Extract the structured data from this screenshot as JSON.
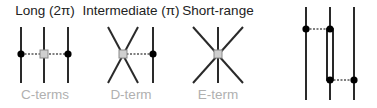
{
  "panels": [
    {
      "title": "Long (2π)",
      "subtitle": "C-terms"
    },
    {
      "title": "Intermediate (π)",
      "subtitle": "D-term"
    },
    {
      "title": "Short-range",
      "subtitle": "E-term"
    }
  ],
  "colors": {
    "line": "#2a2a2a",
    "dot": "#000000",
    "vertex_fill": "#cfcfcf",
    "vertex_stroke": "#8a8a8a",
    "subtitle": "#b0b0b0",
    "title": "#222222"
  }
}
